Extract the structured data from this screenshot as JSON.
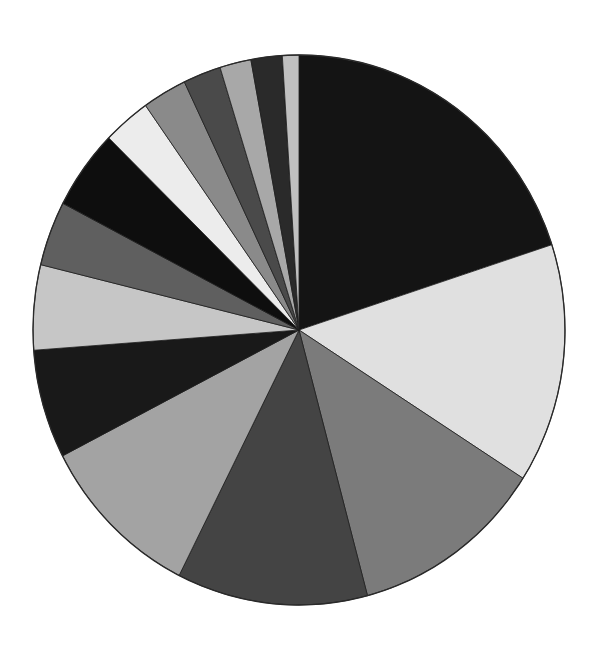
{
  "chart_data": {
    "type": "pie",
    "title": "",
    "start_angle_deg": 0,
    "direction": "clockwise",
    "center": [
      299,
      330
    ],
    "radius_x": 266,
    "radius_y": 275,
    "legend": null,
    "labels_visible": false,
    "slices": [
      {
        "label": "",
        "value": 20.0,
        "color": "#141414"
      },
      {
        "label": "",
        "value": 14.1,
        "color": "#e0e0e0"
      },
      {
        "label": "",
        "value": 11.8,
        "color": "#7b7b7b"
      },
      {
        "label": "",
        "value": 11.6,
        "color": "#444444"
      },
      {
        "label": "",
        "value": 10.0,
        "color": "#a3a3a3"
      },
      {
        "label": "",
        "value": 6.4,
        "color": "#191919"
      },
      {
        "label": "",
        "value": 5.0,
        "color": "#c6c6c6"
      },
      {
        "label": "",
        "value": 3.8,
        "color": "#5f5f5f"
      },
      {
        "label": "",
        "value": 4.7,
        "color": "#0e0e0e"
      },
      {
        "label": "",
        "value": 2.9,
        "color": "#ececec"
      },
      {
        "label": "",
        "value": 2.7,
        "color": "#8a8a8a"
      },
      {
        "label": "",
        "value": 2.3,
        "color": "#4a4a4a"
      },
      {
        "label": "",
        "value": 1.9,
        "color": "#a8a8a8"
      },
      {
        "label": "",
        "value": 1.9,
        "color": "#2a2a2a"
      },
      {
        "label": "",
        "value": 1.0,
        "color": "#c0c0c0"
      }
    ]
  }
}
